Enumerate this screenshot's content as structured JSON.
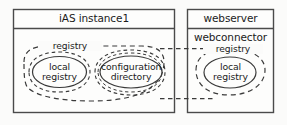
{
  "diagram": {
    "type": "uml-deployment-diagram",
    "background_color": "#fbfbfa",
    "line_color": "#3a3a3a",
    "text_color": "#1b1b1b",
    "nodes": [
      {
        "id": "ias-instance1",
        "title": "iAS instance1",
        "subtitle": "",
        "group_label": "registry",
        "components": [
          {
            "id": "local-registry-left",
            "label_line1": "local",
            "label_line2": "registry"
          },
          {
            "id": "configuration-directory",
            "label_line1": "configuration",
            "label_line2": "directory"
          }
        ]
      },
      {
        "id": "webserver",
        "title": "webserver",
        "subtitle": "webconnector",
        "group_label": "registry",
        "components": [
          {
            "id": "local-registry-right",
            "label_line1": "local",
            "label_line2": "registry"
          }
        ]
      }
    ],
    "connectors": [
      {
        "id": "connector-top",
        "style": "dashed"
      },
      {
        "id": "connector-bottom",
        "style": "dashed"
      }
    ]
  }
}
